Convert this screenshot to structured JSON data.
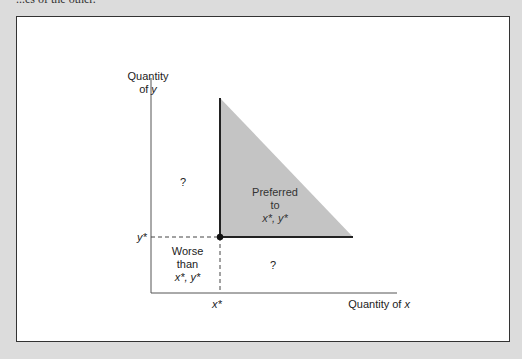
{
  "caption_fragment": "...es of the other.",
  "diagram": {
    "y_axis_label_line1": "Quantity",
    "y_axis_label_line2_prefix": "of ",
    "y_axis_var": "y",
    "x_axis_label_prefix": "Quantity of ",
    "x_axis_var": "x",
    "x_star_label": "x*",
    "y_star_label": "y*",
    "preferred_region": {
      "line1": "Preferred",
      "line2": "to",
      "line3": "x*, y*",
      "fill": "#c4c4c4"
    },
    "worse_region": {
      "line1": "Worse",
      "line2": "than",
      "line3": "x*, y*"
    },
    "upper_left_region": "?",
    "lower_right_region": "?"
  }
}
